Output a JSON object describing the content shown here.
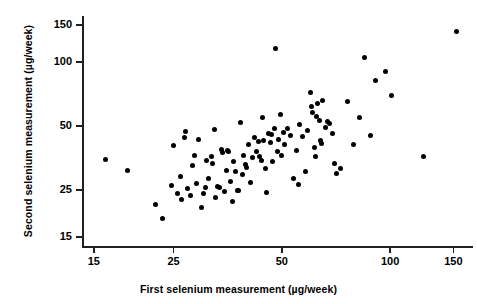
{
  "chart_data": {
    "type": "scatter",
    "title": "",
    "xlabel": "First selenium measurement (µg/week)",
    "ylabel": "Second selenium measurement (µg/week)",
    "xscale": "log",
    "yscale": "log",
    "xlim": [
      14.0,
      170.0
    ],
    "ylim": [
      13.5,
      165.0
    ],
    "xticks": [
      15,
      25,
      50,
      100,
      150
    ],
    "xticklabels": [
      "15",
      "25",
      "50",
      "100",
      "150"
    ],
    "yticks": [
      15,
      25,
      50,
      100,
      150
    ],
    "yticklabels": [
      "15",
      "25",
      "50",
      "100",
      "150"
    ],
    "grid": false,
    "legend": null,
    "marker": "filled-circle",
    "marker_color": "#000000",
    "marker_size_px": 5,
    "n_points": 104,
    "points": [
      [
        16.2,
        35.0
      ],
      [
        18.6,
        31.0
      ],
      [
        22.2,
        21.5
      ],
      [
        23.3,
        18.3
      ],
      [
        24.6,
        26.2
      ],
      [
        25.0,
        40.5
      ],
      [
        25.6,
        24.2
      ],
      [
        26.1,
        29.0
      ],
      [
        26.3,
        22.5
      ],
      [
        26.8,
        44.0
      ],
      [
        27.0,
        47.0
      ],
      [
        27.4,
        25.4
      ],
      [
        27.9,
        23.5
      ],
      [
        28.2,
        32.5
      ],
      [
        28.6,
        36.5
      ],
      [
        29.0,
        26.8
      ],
      [
        29.4,
        43.5
      ],
      [
        29.8,
        20.8
      ],
      [
        30.2,
        24.0
      ],
      [
        30.6,
        25.6
      ],
      [
        30.9,
        34.5
      ],
      [
        31.3,
        28.5
      ],
      [
        31.8,
        36.0
      ],
      [
        32.1,
        33.5
      ],
      [
        32.4,
        48.0
      ],
      [
        32.8,
        23.0
      ],
      [
        33.2,
        26.0
      ],
      [
        33.6,
        25.8
      ],
      [
        34.0,
        39.0
      ],
      [
        34.2,
        37.5
      ],
      [
        34.6,
        24.6
      ],
      [
        35.0,
        31.0
      ],
      [
        35.2,
        38.5
      ],
      [
        35.6,
        37.8
      ],
      [
        36.0,
        27.5
      ],
      [
        36.4,
        22.0
      ],
      [
        36.8,
        34.0
      ],
      [
        37.2,
        30.5
      ],
      [
        37.6,
        24.8
      ],
      [
        38.0,
        25.0
      ],
      [
        38.4,
        52.0
      ],
      [
        38.8,
        29.5
      ],
      [
        39.2,
        36.5
      ],
      [
        39.6,
        33.0
      ],
      [
        40.0,
        32.0
      ],
      [
        40.4,
        41.0
      ],
      [
        41.0,
        27.2
      ],
      [
        41.5,
        35.5
      ],
      [
        42.0,
        44.0
      ],
      [
        42.5,
        38.0
      ],
      [
        43.0,
        42.5
      ],
      [
        43.4,
        36.0
      ],
      [
        43.8,
        34.5
      ],
      [
        44.2,
        55.0
      ],
      [
        44.6,
        43.0
      ],
      [
        45.0,
        31.5
      ],
      [
        45.4,
        24.5
      ],
      [
        46.0,
        46.0
      ],
      [
        46.4,
        42.0
      ],
      [
        46.8,
        45.5
      ],
      [
        47.2,
        34.0
      ],
      [
        47.6,
        48.5
      ],
      [
        48.0,
        116.0
      ],
      [
        48.5,
        38.0
      ],
      [
        49.0,
        43.5
      ],
      [
        49.5,
        57.0
      ],
      [
        50.0,
        36.5
      ],
      [
        50.5,
        46.5
      ],
      [
        51.0,
        41.0
      ],
      [
        52.0,
        49.0
      ],
      [
        53.0,
        45.0
      ],
      [
        54.0,
        28.5
      ],
      [
        55.0,
        38.5
      ],
      [
        55.5,
        26.5
      ],
      [
        56.0,
        51.0
      ],
      [
        57.0,
        44.5
      ],
      [
        58.0,
        30.5
      ],
      [
        59.0,
        47.5
      ],
      [
        60.0,
        72.0
      ],
      [
        60.5,
        62.0
      ],
      [
        61.0,
        58.0
      ],
      [
        61.5,
        39.5
      ],
      [
        62.0,
        36.0
      ],
      [
        62.5,
        55.5
      ],
      [
        63.0,
        64.0
      ],
      [
        63.5,
        53.0
      ],
      [
        64.0,
        43.0
      ],
      [
        64.5,
        41.5
      ],
      [
        65.0,
        66.0
      ],
      [
        66.0,
        49.5
      ],
      [
        67.0,
        52.5
      ],
      [
        68.0,
        51.5
      ],
      [
        69.0,
        46.0
      ],
      [
        70.0,
        33.5
      ],
      [
        71.0,
        29.8
      ],
      [
        73.0,
        31.5
      ],
      [
        76.0,
        65.0
      ],
      [
        79.0,
        41.0
      ],
      [
        82.0,
        55.0
      ],
      [
        85.0,
        105.0
      ],
      [
        88.0,
        45.0
      ],
      [
        91.0,
        82.0
      ],
      [
        97.0,
        90.0
      ],
      [
        101.0,
        70.0
      ],
      [
        124.0,
        36.0
      ],
      [
        153.0,
        140.0
      ]
    ]
  }
}
